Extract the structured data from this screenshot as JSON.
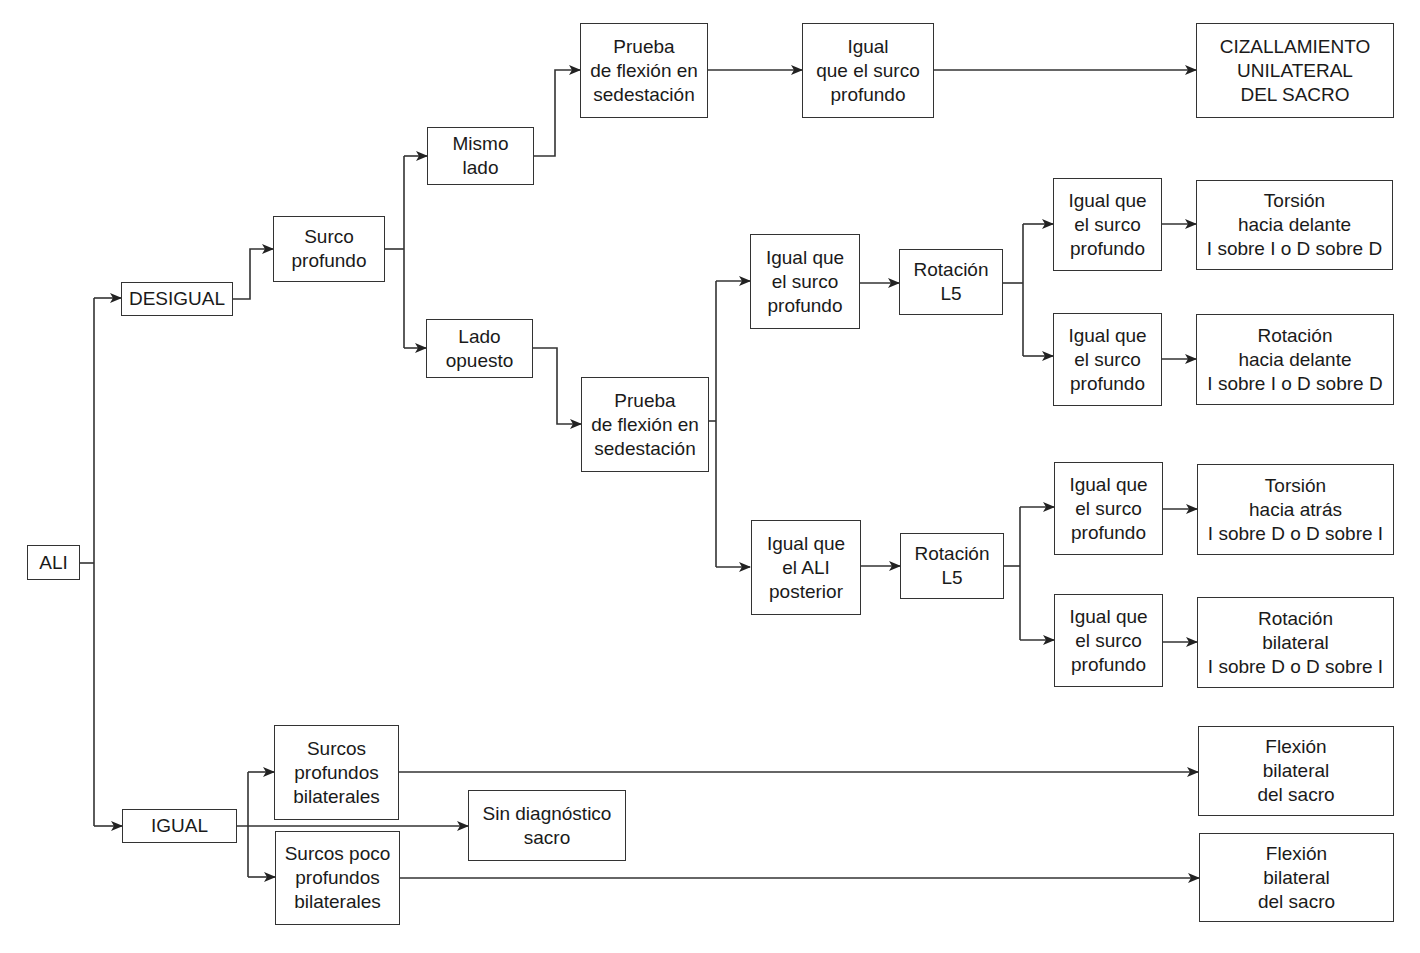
{
  "diagram": {
    "root": "ALI",
    "branches": {
      "desigual": "DESIGUAL",
      "igual": "IGUAL"
    },
    "nodes": {
      "ali": "ALI",
      "desigual": "DESIGUAL",
      "surco_profundo": "Surco\nprofundo",
      "mismo_lado": "Mismo\nlado",
      "lado_opuesto": "Lado\nopuesto",
      "prueba_flexion_1": "Prueba\nde flexión en\nsedestación",
      "igual_surco_top": "Igual\nque el surco\nprofundo",
      "cizallamiento": "CIZALLAMIENTO\nUNILATERAL\nDEL SACRO",
      "prueba_flexion_2": "Prueba\nde flexión en\nsedestación",
      "igual_surco_mid": "Igual que\nel surco\nprofundo",
      "rotacion_l5_a": "Rotación\nL5",
      "igual_surco_a1": "Igual que\nel surco\nprofundo",
      "igual_surco_a2": "Igual que\nel surco\nprofundo",
      "torsion_delante": "Torsión\nhacia delante\nI sobre I o D sobre D",
      "rotacion_delante": "Rotación\nhacia delante\nI sobre I o D sobre D",
      "igual_ali_posterior": "Igual que\nel ALI\nposterior",
      "rotacion_l5_b": "Rotación\nL5",
      "igual_surco_b1": "Igual que\nel surco\nprofundo",
      "igual_surco_b2": "Igual que\nel surco\nprofundo",
      "torsion_atras": "Torsión\nhacia atrás\nI sobre D o D sobre I",
      "rotacion_bilateral": "Rotación\nbilateral\nI sobre D o D sobre I",
      "igual": "IGUAL",
      "surcos_profundos_bilat": "Surcos\nprofundos\nbilaterales",
      "sin_diagnostico": "Sin diagnóstico\nsacro",
      "surcos_poco_profundos": "Surcos poco\nprofundos\nbilaterales",
      "flexion_bilateral_1": "Flexión\nbilateral\ndel sacro",
      "flexion_bilateral_2": "Flexión\nbilateral\ndel sacro"
    },
    "colors": {
      "line": "#333333",
      "background": "#ffffff",
      "text": "#1a1a1a"
    }
  }
}
